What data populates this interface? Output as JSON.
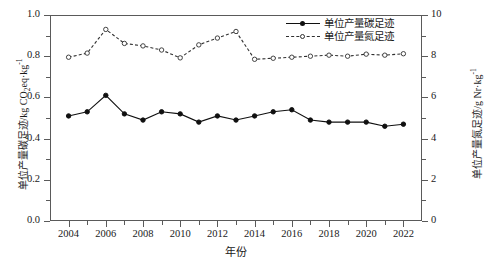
{
  "chart_data": {
    "type": "line",
    "title": "",
    "xlabel": "年份",
    "ylabel": "单位产量碳足迹/kg CO2eq·kg-1",
    "ylabel_right": "单位产量氮足迹/g Nr·kg-1",
    "x": [
      2004,
      2005,
      2006,
      2007,
      2008,
      2009,
      2010,
      2011,
      2012,
      2013,
      2014,
      2015,
      2016,
      2017,
      2018,
      2019,
      2020,
      2021,
      2022
    ],
    "xlim": [
      2003,
      2023
    ],
    "xticks": [
      2004,
      2006,
      2008,
      2010,
      2012,
      2014,
      2016,
      2018,
      2020,
      2022
    ],
    "ylim": [
      0.0,
      1.0
    ],
    "yticks": [
      0.0,
      0.2,
      0.4,
      0.6,
      0.8,
      1.0
    ],
    "ylim_right": [
      0,
      10
    ],
    "yticks_right": [
      0,
      2,
      4,
      6,
      8,
      10
    ],
    "grid": false,
    "legend_position": "top-right",
    "series": [
      {
        "name": "单位产量碳足迹",
        "axis": "left",
        "marker": "filled-circle",
        "linestyle": "solid",
        "color": "#101010",
        "values": [
          0.51,
          0.53,
          0.61,
          0.52,
          0.49,
          0.53,
          0.52,
          0.48,
          0.51,
          0.49,
          0.51,
          0.53,
          0.54,
          0.49,
          0.48,
          0.48,
          0.48,
          0.46,
          0.47
        ]
      },
      {
        "name": "单位产量氮足迹",
        "axis": "right",
        "marker": "open-circle",
        "linestyle": "dashed",
        "color": "#303030",
        "values": [
          7.95,
          8.15,
          9.3,
          8.62,
          8.5,
          8.3,
          7.92,
          8.55,
          8.88,
          9.2,
          7.85,
          7.9,
          7.95,
          8.0,
          8.05,
          8.0,
          8.1,
          8.05,
          8.12
        ]
      }
    ]
  },
  "axis_labels": {
    "y_left_main": "单位产量碳足迹/kg CO",
    "y_left_sub": "2",
    "y_left_mid": "eq·kg",
    "y_left_sup": "-1",
    "y_right_main": "单位产量氮足迹/g Nr·kg",
    "y_right_sup": "-1",
    "x_title": "年份"
  },
  "legend": {
    "items": [
      {
        "label": "单位产量碳足迹",
        "style": "solid-filled"
      },
      {
        "label": "单位产量氮足迹",
        "style": "dashed-open"
      }
    ]
  },
  "ticks": {
    "y_left": [
      "1.0",
      "0.8",
      "0.6",
      "0.4",
      "0.2",
      "0.0"
    ],
    "y_right": [
      "10",
      "8",
      "6",
      "4",
      "2",
      "0"
    ],
    "x": [
      "2004",
      "2006",
      "2008",
      "2010",
      "2012",
      "2014",
      "2016",
      "2018",
      "2020",
      "2022"
    ]
  },
  "colors": {
    "carbon": "#101010",
    "nitrogen": "#303030",
    "axis": "#5a5a5a",
    "background": "#ffffff"
  }
}
